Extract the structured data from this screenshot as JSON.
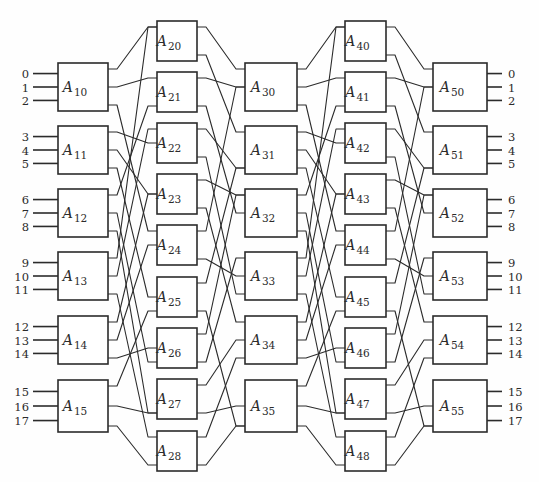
{
  "figure": {
    "kind": "switching-network-diagram",
    "ink_color": "#2b2b2b",
    "background_color": "#fefefe",
    "box_fill": "#ffffff",
    "partial_caption_top": ""
  },
  "inputs": {
    "label": "input terminals",
    "labels": [
      "0",
      "1",
      "2",
      "3",
      "4",
      "5",
      "6",
      "7",
      "8",
      "9",
      "10",
      "11",
      "12",
      "13",
      "14",
      "15",
      "16",
      "17"
    ]
  },
  "outputs": {
    "label": "output terminals",
    "labels": [
      "0",
      "1",
      "2",
      "3",
      "4",
      "5",
      "6",
      "7",
      "8",
      "9",
      "10",
      "11",
      "12",
      "13",
      "14",
      "15",
      "16",
      "17"
    ]
  },
  "stages": [
    {
      "name": "stage-1",
      "x": 58,
      "w": 50,
      "boxes": [
        {
          "label": "A",
          "sub": "10",
          "y": 63,
          "h": 48
        },
        {
          "label": "A",
          "sub": "11",
          "y": 126,
          "h": 48
        },
        {
          "label": "A",
          "sub": "12",
          "y": 189,
          "h": 48
        },
        {
          "label": "A",
          "sub": "13",
          "y": 252,
          "h": 48
        },
        {
          "label": "A",
          "sub": "14",
          "y": 316,
          "h": 48
        },
        {
          "label": "A",
          "sub": "15",
          "y": 380,
          "h": 52
        }
      ]
    },
    {
      "name": "stage-2",
      "x": 157,
      "w": 40,
      "boxes": [
        {
          "label": "A",
          "sub": "20",
          "y": 21,
          "h": 40
        },
        {
          "label": "A",
          "sub": "21",
          "y": 72,
          "h": 40
        },
        {
          "label": "A",
          "sub": "22",
          "y": 123,
          "h": 40
        },
        {
          "label": "A",
          "sub": "23",
          "y": 174,
          "h": 40
        },
        {
          "label": "A",
          "sub": "24",
          "y": 225,
          "h": 40
        },
        {
          "label": "A",
          "sub": "25",
          "y": 277,
          "h": 40
        },
        {
          "label": "A",
          "sub": "26",
          "y": 328,
          "h": 40
        },
        {
          "label": "A",
          "sub": "27",
          "y": 379,
          "h": 40
        },
        {
          "label": "A",
          "sub": "28",
          "y": 431,
          "h": 40
        }
      ]
    },
    {
      "name": "stage-3",
      "x": 245,
      "w": 52,
      "boxes": [
        {
          "label": "A",
          "sub": "30",
          "y": 63,
          "h": 48
        },
        {
          "label": "A",
          "sub": "31",
          "y": 126,
          "h": 48
        },
        {
          "label": "A",
          "sub": "32",
          "y": 189,
          "h": 48
        },
        {
          "label": "A",
          "sub": "33",
          "y": 252,
          "h": 48
        },
        {
          "label": "A",
          "sub": "34",
          "y": 316,
          "h": 48
        },
        {
          "label": "A",
          "sub": "35",
          "y": 380,
          "h": 52
        }
      ]
    },
    {
      "name": "stage-4",
      "x": 345,
      "w": 41,
      "boxes": [
        {
          "label": "A",
          "sub": "40",
          "y": 21,
          "h": 40
        },
        {
          "label": "A",
          "sub": "41",
          "y": 72,
          "h": 40
        },
        {
          "label": "A",
          "sub": "42",
          "y": 123,
          "h": 40
        },
        {
          "label": "A",
          "sub": "43",
          "y": 174,
          "h": 40
        },
        {
          "label": "A",
          "sub": "44",
          "y": 225,
          "h": 40
        },
        {
          "label": "A",
          "sub": "45",
          "y": 277,
          "h": 40
        },
        {
          "label": "A",
          "sub": "46",
          "y": 328,
          "h": 40
        },
        {
          "label": "A",
          "sub": "47",
          "y": 379,
          "h": 40
        },
        {
          "label": "A",
          "sub": "48",
          "y": 431,
          "h": 40
        }
      ]
    },
    {
      "name": "stage-5",
      "x": 433,
      "w": 54,
      "boxes": [
        {
          "label": "A",
          "sub": "50",
          "y": 63,
          "h": 48
        },
        {
          "label": "A",
          "sub": "51",
          "y": 126,
          "h": 48
        },
        {
          "label": "A",
          "sub": "52",
          "y": 189,
          "h": 48
        },
        {
          "label": "A",
          "sub": "53",
          "y": 252,
          "h": 48
        },
        {
          "label": "A",
          "sub": "54",
          "y": 316,
          "h": 48
        },
        {
          "label": "A",
          "sub": "55",
          "y": 380,
          "h": 52
        }
      ]
    }
  ],
  "link_groups": {
    "stage1_to_stage2": "each stage-1 box fans out three links to three of the nine stage-2 boxes",
    "stage2_to_stage3": "each stage-2 box fans out links to the six stage-3 boxes",
    "stage3_to_stage4": "each stage-3 box fans out links to the nine stage-4 boxes",
    "stage4_to_stage5": "each stage-4 box fans out three links to the six stage-5 boxes"
  }
}
